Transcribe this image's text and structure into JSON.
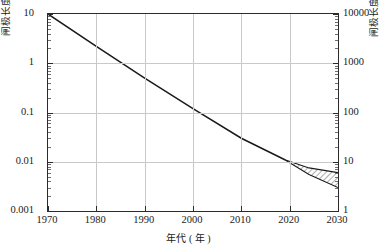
{
  "chart_data": {
    "type": "line",
    "title": "",
    "xlabel": "年代 ( 年 )",
    "ylabel": "闸极长度 (μm)",
    "ylabel_right": "闸极长度 (nm)",
    "xlim": [
      1970,
      2030
    ],
    "ylim": [
      0.001,
      10
    ],
    "ylim_right": [
      1,
      10000
    ],
    "yscale": "log",
    "xscale": "linear",
    "grid": true,
    "legend": "none",
    "xticks": [
      "1970",
      "1980",
      "1990",
      "2000",
      "2010",
      "2020",
      "2030"
    ],
    "xtick_values": [
      1970,
      1980,
      1990,
      2000,
      2010,
      2020,
      2030
    ],
    "yticks": [
      "10",
      "1",
      "0.1",
      "0.01",
      "0.001"
    ],
    "ytick_values": [
      10,
      1,
      0.1,
      0.01,
      0.001
    ],
    "yticks_right": [
      "10000",
      "1000",
      "100",
      "10",
      "1"
    ],
    "ytick_values_right": [
      10000,
      1000,
      100,
      10,
      1
    ],
    "series": [
      {
        "name": "闸极长度趋势",
        "x": [
          1970,
          1980,
          1990,
          2000,
          2010,
          2019
        ],
        "values": [
          10.0,
          2.2,
          0.5,
          0.12,
          0.03,
          0.011
        ]
      },
      {
        "name": "预测上界",
        "x": [
          2019,
          2024,
          2030
        ],
        "values": [
          0.011,
          0.0075,
          0.006
        ]
      },
      {
        "name": "预测下界",
        "x": [
          2019,
          2024,
          2030
        ],
        "values": [
          0.011,
          0.0055,
          0.003
        ]
      }
    ],
    "shaded_region": {
      "name": "预测范围 (阴影斜线区)",
      "x_start": 2019,
      "x_end": 2030,
      "y_upper_end": 0.006,
      "y_lower_end": 0.003,
      "hatch": "diagonal"
    },
    "colors": {
      "line": "#1a1a1a",
      "grid": "#c9c9c9",
      "axis": "#2b2b2b",
      "background": "#ffffff"
    }
  }
}
